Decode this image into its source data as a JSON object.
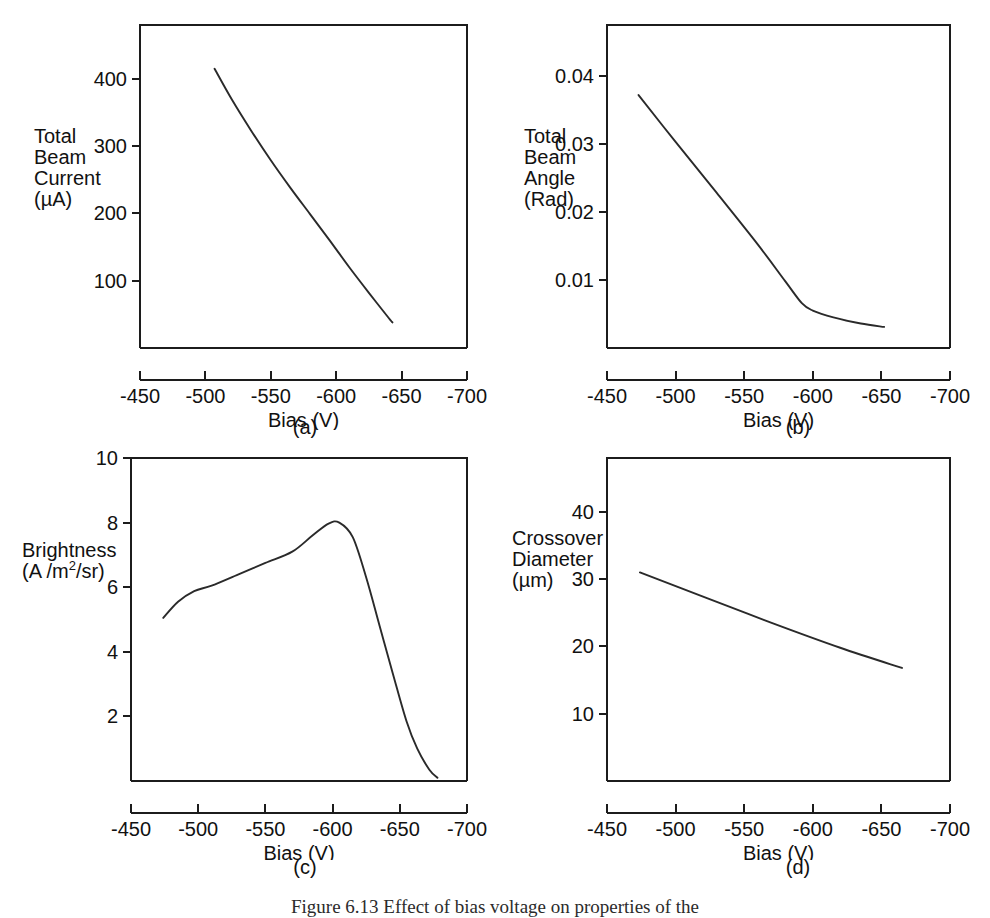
{
  "figure": {
    "caption": "Figure  6.13   Effect of bias voltage on properties of the",
    "panel_letters": [
      "(a)",
      "(b)",
      "(c)",
      "(d)"
    ]
  },
  "axis": {
    "x_title": "Bias  (V)",
    "x_ticks": [
      "-450",
      "-500",
      "-550",
      "-600",
      "-650",
      "-700"
    ],
    "x_values": [
      -450,
      -500,
      -550,
      -600,
      -650,
      -700
    ]
  },
  "chart_data": [
    {
      "id": "a",
      "type": "line",
      "panel_label": "(a)",
      "title": "",
      "xlabel": "Bias  (V)",
      "ylabel": "Total Beam Current (µA)",
      "ylabel_lines": [
        "Total",
        "Beam",
        "Current",
        "(µA)"
      ],
      "xlim": [
        -450,
        -700
      ],
      "ylim": [
        0,
        480
      ],
      "xticks": [
        -450,
        -500,
        -550,
        -600,
        -650,
        -700
      ],
      "xticklabels": [
        "-450",
        "-500",
        "-550",
        "-600",
        "-650",
        "-700"
      ],
      "yticks": [
        100,
        200,
        300,
        400
      ],
      "yticklabels": [
        "100",
        "200",
        "300",
        "400"
      ],
      "grid": false,
      "legend": null,
      "x": [
        -507,
        -520,
        -535,
        -550,
        -565,
        -580,
        -595,
        -610,
        -625,
        -640,
        -643
      ],
      "y": [
        415,
        370,
        323,
        279,
        238,
        199,
        160,
        120,
        82,
        45,
        38
      ]
    },
    {
      "id": "b",
      "type": "line",
      "panel_label": "(b)",
      "title": "",
      "xlabel": "Bias  (V)",
      "ylabel": "Total Beam Angle (Rad)",
      "ylabel_lines": [
        "Total",
        "Beam",
        "Angle",
        "(Rad)"
      ],
      "xlim": [
        -450,
        -700
      ],
      "ylim": [
        0,
        0.0475
      ],
      "xticks": [
        -450,
        -500,
        -550,
        -600,
        -650,
        -700
      ],
      "xticklabels": [
        "-450",
        "-500",
        "-550",
        "-600",
        "-650",
        "-700"
      ],
      "yticks": [
        0.01,
        0.02,
        0.03,
        0.04
      ],
      "yticklabels": [
        "0.01",
        "0.02",
        "0.03",
        "0.04"
      ],
      "grid": false,
      "legend": null,
      "x": [
        -473,
        -500,
        -530,
        -560,
        -580,
        -592,
        -600,
        -615,
        -635,
        -652
      ],
      "y": [
        0.0372,
        0.0303,
        0.0228,
        0.0152,
        0.0098,
        0.0066,
        0.0055,
        0.0045,
        0.0036,
        0.0031
      ]
    },
    {
      "id": "c",
      "type": "line",
      "panel_label": "(c)",
      "title": "",
      "xlabel": "Bias  (V)",
      "ylabel": "Brightness (A /m2/sr)",
      "ylabel_lines": [
        "Brightness",
        "(A /m²/sr)"
      ],
      "xlim": [
        -450,
        -700
      ],
      "ylim": [
        0,
        10
      ],
      "xticks": [
        -450,
        -500,
        -550,
        -600,
        -650,
        -700
      ],
      "xticklabels": [
        "-450",
        "-500",
        "-550",
        "-600",
        "-650",
        "-700"
      ],
      "yticks": [
        2,
        4,
        6,
        8,
        10
      ],
      "yticklabels": [
        "2",
        "4",
        "6",
        "8",
        "10"
      ],
      "grid": false,
      "legend": null,
      "x": [
        -474,
        -485,
        -497,
        -510,
        -530,
        -550,
        -570,
        -585,
        -597,
        -605,
        -615,
        -625,
        -635,
        -645,
        -655,
        -663,
        -672,
        -678
      ],
      "y": [
        5.05,
        5.55,
        5.88,
        6.05,
        6.4,
        6.75,
        7.1,
        7.6,
        7.97,
        8.0,
        7.55,
        6.3,
        4.8,
        3.3,
        1.85,
        1.0,
        0.35,
        0.1
      ]
    },
    {
      "id": "d",
      "type": "line",
      "panel_label": "(d)",
      "title": "",
      "xlabel": "Bias  (V)",
      "ylabel": "Crossover Diameter (µm)",
      "ylabel_lines": [
        "Crossover",
        "Diameter",
        "(µm)"
      ],
      "xlim": [
        -450,
        -700
      ],
      "ylim": [
        0,
        48
      ],
      "xticks": [
        -450,
        -500,
        -550,
        -600,
        -650,
        -700
      ],
      "xticklabels": [
        "-450",
        "-500",
        "-550",
        "-600",
        "-650",
        "-700"
      ],
      "yticks": [
        10,
        20,
        30,
        40
      ],
      "yticklabels": [
        "10",
        "20",
        "30",
        "40"
      ],
      "grid": false,
      "legend": null,
      "x": [
        -474,
        -520,
        -570,
        -620,
        -665
      ],
      "y": [
        31.0,
        27.4,
        23.5,
        19.8,
        16.8
      ]
    }
  ]
}
